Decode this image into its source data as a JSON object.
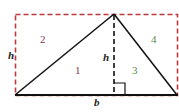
{
  "diagram": {
    "labels": {
      "h_left": "h",
      "h_middle": "h",
      "b": "b",
      "region_1": "1",
      "region_2": "2",
      "region_3": "3",
      "region_4": "4"
    },
    "colors": {
      "rectangle_dash": "#c0393b",
      "triangle_stroke": "#111111",
      "label_1_2": "#8b3a5a",
      "label_3_4": "#5a8a4a",
      "variable_labels": "#222222"
    }
  }
}
